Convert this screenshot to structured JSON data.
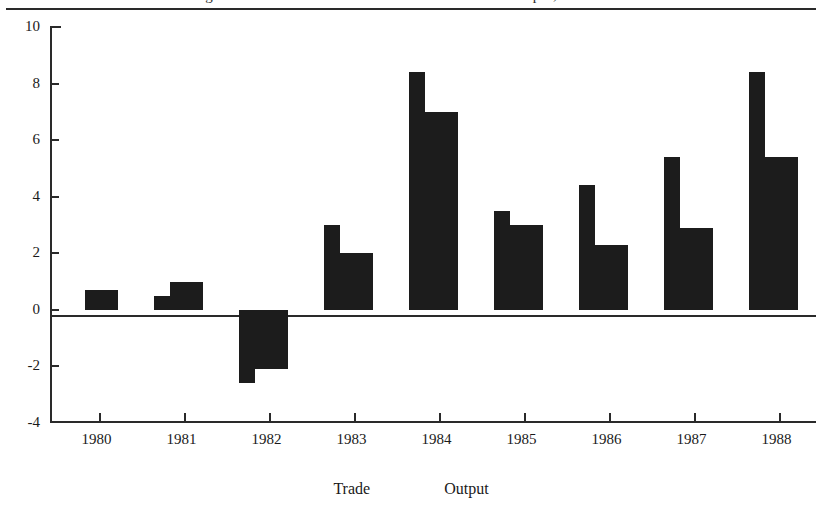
{
  "figure": {
    "caption_partial": "Figure 1. Growth of world merchandise trade and output, 1980-1988",
    "legend_position": "bottom-center"
  },
  "chart_data": {
    "type": "bar",
    "title": "",
    "xlabel": "",
    "ylabel": "",
    "categories": [
      "1980",
      "1981",
      "1982",
      "1983",
      "1984",
      "1985",
      "1986",
      "1987",
      "1988"
    ],
    "series": [
      {
        "name": "Trade",
        "values": [
          0.0,
          0.5,
          -2.6,
          3.0,
          8.4,
          3.5,
          4.4,
          5.4,
          8.4
        ]
      },
      {
        "name": "Output",
        "values": [
          0.7,
          1.0,
          -2.1,
          2.0,
          7.0,
          3.0,
          2.3,
          2.9,
          5.4
        ]
      }
    ],
    "ylim": [
      -4,
      10
    ],
    "yticks": [
      "10",
      "8",
      "6",
      "4",
      "2",
      "0",
      "-2",
      "-4"
    ],
    "ytick_values": [
      10,
      8,
      6,
      4,
      2,
      0,
      -2,
      -4
    ],
    "grid": false,
    "bar_color": "#1c1c1c",
    "axis_color": "#2a2a2a"
  },
  "legend": {
    "items": [
      {
        "label": "Trade"
      },
      {
        "label": "Output"
      }
    ]
  }
}
